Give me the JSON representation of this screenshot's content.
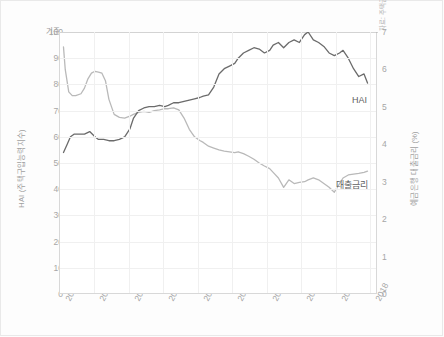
{
  "figure": {
    "source_note": "자료: 주택금융공사 · 한국은행",
    "baseline_label": "기준",
    "colors": {
      "hai_line": "#6b6b6b",
      "rate_line": "#b9b9b9",
      "baseline": "#a8a8a8",
      "grid": "#f0f0f0",
      "axis": "#d8d8d8",
      "tick_text": "#a6a6a6"
    }
  },
  "chart_data": {
    "type": "line",
    "title": "",
    "xlabel": "",
    "ylabel": "HAI (주택구입능력지수)",
    "y2label": "예금은행 대출금리 (%)",
    "xlim": [
      2008.9,
      2018.0
    ],
    "ylim": [
      0,
      100
    ],
    "y2lim": [
      0,
      7
    ],
    "grid": true,
    "legend": "inline-labels",
    "x_ticks": [
      "2009",
      "2010",
      "2011",
      "2012",
      "2013",
      "2014",
      "2015",
      "2016",
      "2017",
      "2018"
    ],
    "y_ticks_left": [
      0,
      10,
      20,
      30,
      40,
      50,
      60,
      70,
      80,
      90,
      100
    ],
    "y_ticks_right": [
      0,
      1,
      2,
      3,
      4,
      5,
      6,
      7
    ],
    "annotations": [
      {
        "text": "기준",
        "at_y_left": 100,
        "note": "baseline reference line at HAI = 100"
      },
      {
        "text": "HAI",
        "at_x": 2017.2,
        "at_y_left": 76
      },
      {
        "text": "대출금리",
        "at_x": 2017.0,
        "at_y_right": 3.0
      }
    ],
    "series": [
      {
        "name": "HAI",
        "axis": "left",
        "unit": "index",
        "color": "#6b6b6b",
        "x": [
          2009.0,
          2009.1,
          2009.2,
          2009.3,
          2009.4,
          2009.5,
          2009.6,
          2009.75,
          2009.9,
          2010.0,
          2010.15,
          2010.3,
          2010.45,
          2010.6,
          2010.75,
          2010.9,
          2011.0,
          2011.15,
          2011.3,
          2011.45,
          2011.6,
          2011.75,
          2011.9,
          2012.0,
          2012.15,
          2012.3,
          2012.45,
          2012.6,
          2012.75,
          2012.9,
          2013.0,
          2013.15,
          2013.3,
          2013.45,
          2013.6,
          2013.75,
          2013.9,
          2014.0,
          2014.15,
          2014.3,
          2014.45,
          2014.6,
          2014.75,
          2014.9,
          2015.0,
          2015.15,
          2015.3,
          2015.45,
          2015.6,
          2015.75,
          2015.9,
          2016.0,
          2016.15,
          2016.3,
          2016.45,
          2016.6,
          2016.75,
          2016.9,
          2017.0,
          2017.15,
          2017.3,
          2017.45,
          2017.6,
          2017.7
        ],
        "values": [
          54,
          57,
          60,
          61,
          61,
          61,
          61,
          62,
          60,
          59,
          59,
          58.5,
          58.5,
          59,
          60,
          63,
          67,
          70,
          71,
          71.5,
          71.5,
          72,
          71.5,
          72,
          73,
          73,
          73.5,
          74,
          74.5,
          75,
          75.5,
          76,
          79,
          84,
          86,
          87,
          88,
          90,
          92,
          93,
          94,
          93.5,
          92,
          93,
          95,
          96,
          94,
          96,
          97,
          96,
          99,
          100,
          97,
          96,
          94.5,
          92,
          91,
          92,
          93,
          90,
          86,
          83,
          84,
          80.5
        ]
      },
      {
        "name": "대출금리",
        "axis": "right",
        "unit": "%",
        "color": "#b9b9b9",
        "x": [
          2009.0,
          2009.05,
          2009.15,
          2009.25,
          2009.35,
          2009.5,
          2009.6,
          2009.7,
          2009.8,
          2009.9,
          2010.0,
          2010.1,
          2010.2,
          2010.3,
          2010.45,
          2010.6,
          2010.75,
          2010.9,
          2011.0,
          2011.15,
          2011.3,
          2011.45,
          2011.6,
          2011.75,
          2011.9,
          2012.0,
          2012.15,
          2012.3,
          2012.45,
          2012.6,
          2012.75,
          2012.9,
          2013.0,
          2013.15,
          2013.3,
          2013.45,
          2013.6,
          2013.75,
          2013.9,
          2014.0,
          2014.15,
          2014.3,
          2014.45,
          2014.6,
          2014.75,
          2014.9,
          2015.0,
          2015.15,
          2015.3,
          2015.45,
          2015.6,
          2015.75,
          2015.9,
          2016.0,
          2016.15,
          2016.3,
          2016.45,
          2016.6,
          2016.75,
          2016.9,
          2017.0,
          2017.15,
          2017.3,
          2017.45,
          2017.6,
          2017.7
        ],
        "values_right_axis": [
          6.6,
          6.0,
          5.4,
          5.3,
          5.3,
          5.35,
          5.5,
          5.75,
          5.9,
          5.95,
          5.93,
          5.9,
          5.7,
          5.2,
          4.8,
          4.72,
          4.7,
          4.75,
          4.8,
          4.85,
          4.88,
          4.85,
          4.9,
          4.92,
          4.95,
          4.95,
          4.97,
          4.92,
          4.7,
          4.4,
          4.2,
          4.1,
          4.05,
          3.95,
          3.9,
          3.85,
          3.82,
          3.8,
          3.78,
          3.8,
          3.75,
          3.68,
          3.6,
          3.5,
          3.42,
          3.35,
          3.25,
          3.1,
          2.85,
          3.05,
          2.95,
          2.98,
          3.0,
          3.05,
          3.1,
          3.05,
          2.95,
          2.85,
          2.72,
          2.95,
          3.1,
          3.18,
          3.2,
          3.22,
          3.25,
          3.28
        ]
      }
    ],
    "baseline_series": {
      "name": "기준",
      "axis": "left",
      "value": 100,
      "color": "#a8a8a8"
    }
  }
}
